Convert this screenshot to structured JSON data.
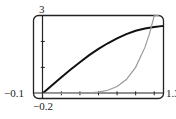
{
  "chart_data": {
    "type": "line",
    "title": "",
    "xlabel": "",
    "ylabel": "",
    "xlim": [
      -0.1,
      1.3
    ],
    "ylim": [
      -0.2,
      3
    ],
    "grid": false,
    "legend": null,
    "axis_labels": {
      "ymax": "3",
      "ymin": "−0.2",
      "xmin": "−0.1",
      "xmax": "1.3"
    },
    "x_ticks": [
      0.2,
      0.4,
      0.6,
      0.8,
      1.0,
      1.2
    ],
    "y_ticks": [
      1,
      2
    ],
    "series": [
      {
        "name": "dark curve",
        "color": "#111111",
        "x": [
          0,
          0.1,
          0.2,
          0.3,
          0.4,
          0.5,
          0.6,
          0.7,
          0.8,
          0.9,
          1.0,
          1.1,
          1.2,
          1.3
        ],
        "y": [
          0,
          0.31,
          0.62,
          0.92,
          1.2,
          1.47,
          1.71,
          1.93,
          2.12,
          2.28,
          2.41,
          2.5,
          2.56,
          2.6
        ]
      },
      {
        "name": "gray curve",
        "color": "#9a9a9a",
        "x": [
          0,
          0.1,
          0.2,
          0.3,
          0.4,
          0.5,
          0.6,
          0.7,
          0.8,
          0.9,
          1.0,
          1.1,
          1.15,
          1.2,
          1.25
        ],
        "y": [
          0,
          0.0,
          0.0,
          0.0,
          0.004,
          0.016,
          0.047,
          0.118,
          0.262,
          0.531,
          1.0,
          1.77,
          2.31,
          2.99,
          3.0
        ]
      }
    ]
  }
}
